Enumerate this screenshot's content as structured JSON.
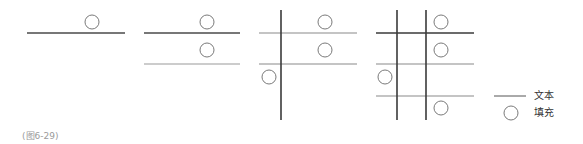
{
  "figure": {
    "caption": "(图6-29)",
    "colors": {
      "primary_line": "#4a4a4a",
      "secondary_line": "#9a9a9a",
      "circle_stroke": "#7a7a7a"
    },
    "panels": [
      {
        "id": 1,
        "vertical_lines": 0,
        "horizontal_lines": 1,
        "circles": 1
      },
      {
        "id": 2,
        "vertical_lines": 0,
        "horizontal_lines": 2,
        "circles": 2
      },
      {
        "id": 3,
        "vertical_lines": 1,
        "horizontal_lines": 2,
        "circles": 3
      },
      {
        "id": 4,
        "vertical_lines": 2,
        "horizontal_lines": 3,
        "circles": 4
      }
    ]
  },
  "legend": {
    "line_label": "文本",
    "circle_label": "填充"
  }
}
